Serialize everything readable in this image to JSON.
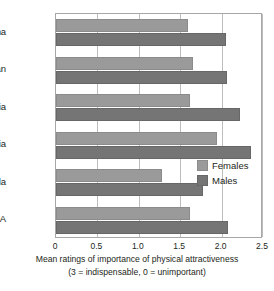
{
  "chart_data": {
    "type": "bar",
    "orientation": "horizontal",
    "title": "",
    "xlabel": "Mean ratings of importance of physical attractiveness",
    "xlabel_note": "(3 = indispensable, 0 = unimportant)",
    "ylabel": "",
    "categories": [
      "China",
      "Iran",
      "Zambia",
      "Bulgaria",
      "Venezuela",
      "USA"
    ],
    "series": [
      {
        "name": "Females",
        "color": "#9a9a9a",
        "values": [
          1.6,
          1.65,
          1.62,
          1.95,
          1.28,
          1.62
        ]
      },
      {
        "name": "Males",
        "color": "#757575",
        "values": [
          2.05,
          2.07,
          2.22,
          2.36,
          1.78,
          2.08
        ]
      }
    ],
    "xlim": [
      0,
      2.5
    ],
    "xticks": [
      0,
      0.5,
      1.0,
      1.5,
      2.0,
      2.5
    ],
    "xticklabels": [
      "0",
      "0.5",
      "1.0",
      "1.5",
      "2.0",
      "2.5"
    ],
    "grid": true,
    "grid_axis": "x",
    "legend_position": "inside-right"
  },
  "legend": {
    "items": [
      {
        "label": "Females"
      },
      {
        "label": "Males"
      }
    ]
  },
  "colors": {
    "females": "#9a9a9a",
    "males": "#757575",
    "gridline": "#bdbdbd",
    "frame": "#a7a7a7",
    "text": "#231f20",
    "background": "#ffffff"
  }
}
